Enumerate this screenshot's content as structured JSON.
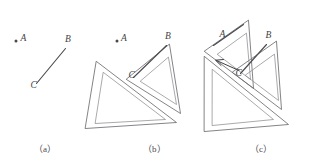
{
  "figure": {
    "background_color": "#ffffff",
    "ink_color": "#4b4b50",
    "ruler_color": "#6e6e72",
    "panels": [
      {
        "id": "a",
        "caption": "（a）",
        "description": "Given point A and line segment BC",
        "labels": [
          {
            "name": "point-a",
            "text": "A",
            "x": 23,
            "y": 41
          },
          {
            "name": "point-b",
            "text": "B",
            "x": 66,
            "y": 43
          },
          {
            "name": "point-c",
            "text": "C",
            "x": 33,
            "y": 85
          }
        ],
        "point_marker": {
          "name": "point-a-dot",
          "x": 16,
          "y": 41,
          "r": 1.5
        },
        "segment": {
          "name": "segment-bc",
          "x1": 36,
          "y1": 83,
          "x2": 65,
          "y2": 49
        }
      },
      {
        "id": "b",
        "caption": "（b）",
        "description": "Align one set square's edge with line BC, press the second set square against it",
        "labels": [
          {
            "name": "point-a",
            "text": "A",
            "x": 124,
            "y": 41
          },
          {
            "name": "point-b",
            "text": "B",
            "x": 166,
            "y": 40
          },
          {
            "name": "point-c",
            "text": "C",
            "x": 131,
            "y": 74
          }
        ],
        "point_marker": {
          "name": "point-a-dot",
          "x": 117,
          "y": 41,
          "r": 1.5
        },
        "segment": {
          "name": "segment-bc",
          "x1": 133,
          "y1": 77,
          "x2": 166,
          "y2": 46
        }
      },
      {
        "id": "c",
        "caption": "（c）",
        "description": "Slide the first set square along the second until its edge reaches point A, then draw the parallel line",
        "labels": [
          {
            "name": "point-a",
            "text": "A",
            "x": 222,
            "y": 35
          },
          {
            "name": "point-b",
            "text": "B",
            "x": 267,
            "y": 39
          },
          {
            "name": "point-c",
            "text": "C",
            "x": 238,
            "y": 73
          }
        ],
        "slide_arrow": {
          "name": "slide-direction-arrow",
          "label": "",
          "x1": 239,
          "y1": 70,
          "x2": 216,
          "y2": 60
        },
        "segments": [
          {
            "name": "segment-parallel-through-a",
            "x1": 214,
            "y1": 45,
            "x2": 242,
            "y2": 25
          },
          {
            "name": "segment-bc",
            "x1": 240,
            "y1": 73,
            "x2": 266,
            "y2": 45
          }
        ]
      }
    ]
  }
}
